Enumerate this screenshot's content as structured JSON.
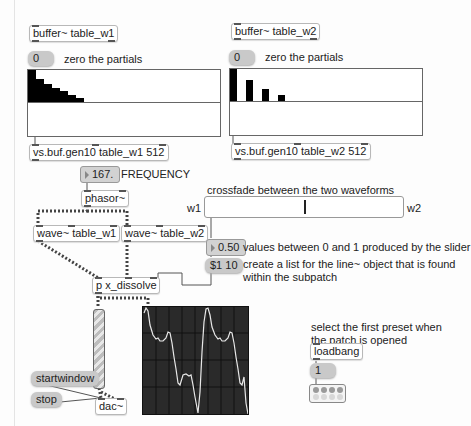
{
  "patch": {
    "left_section": {
      "buffer_object": "buffer~ table_w1",
      "zero_message": "0",
      "zero_comment": "zero the partials",
      "multislider_values": [
        1.0,
        0.5,
        0.33,
        0.25,
        0.2,
        0.17,
        0.14,
        0.125,
        0.11
      ],
      "gen_object": "vs.buf.gen10 table_w1 512"
    },
    "right_section": {
      "buffer_object": "buffer~ table_w2",
      "zero_message": "0",
      "zero_comment": "zero the partials",
      "multislider_values": [
        1.0,
        0,
        0.33,
        0,
        0.2,
        0,
        0.14
      ],
      "gen_object": "vs.buf.gen10 table_w2 512"
    },
    "frequency": {
      "number_value": "167.",
      "label": "FREQUENCY"
    },
    "phasor_object": "phasor~",
    "wave1_object": "wave~ table_w1",
    "wave2_object": "wave~ table_w2",
    "crossfade": {
      "comment": "crossfade between the two waveforms",
      "left_label": "w1",
      "right_label": "w2",
      "slider_value": 0.5
    },
    "float_number": {
      "value": "0.50",
      "comment": "values between 0 and 1 produced by the slider"
    },
    "list_message": {
      "value": "$1 10",
      "comment_line1": "create a list for the line~ object that is found",
      "comment_line2": "within the subpatch"
    },
    "dissolve_object": "p x_dissolve",
    "startwindow_message": "startwindow",
    "stop_message": "stop",
    "dac_object": "dac~",
    "preset_section": {
      "comment_line1": "select the first preset when",
      "comment_line2": "the patch is opened",
      "loadbang_object": "loadbang",
      "preset_message": "1"
    },
    "colors": {
      "background": "#fdfdfd",
      "scope_bg": "#2a2a2a",
      "scope_trace": "#e8e8e8",
      "message_bg": "#c9c9c9",
      "multislider_bar": "#000000"
    }
  }
}
